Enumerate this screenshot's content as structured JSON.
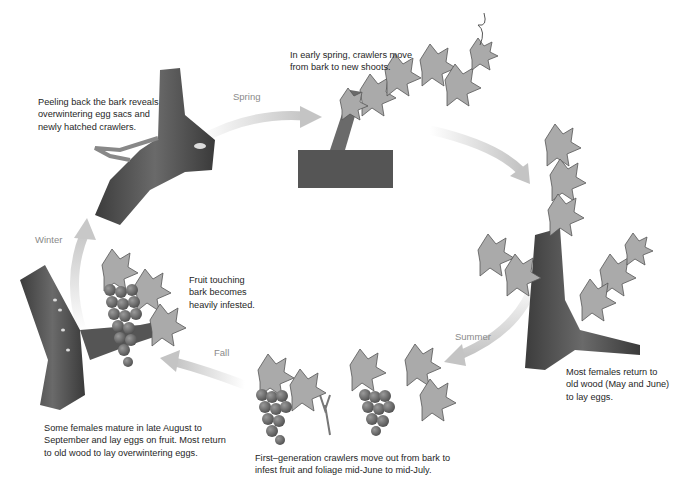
{
  "seasons": {
    "spring": "Spring",
    "summer": "Summer",
    "fall": "Fall",
    "winter": "Winter"
  },
  "captions": {
    "winter_bark": [
      "Peeling back the bark reveals",
      "overwintering egg sacs and",
      "newly hatched crawlers."
    ],
    "spring_shoots": [
      "In early spring, crawlers move",
      "from bark to new shoots."
    ],
    "summer_old_wood": [
      "Most females return to",
      "old wood (May and June)",
      "to lay eggs."
    ],
    "first_generation": [
      "First–generation crawlers move out from bark to",
      "infest fruit and foliage mid-June to mid-July."
    ],
    "fruit_touching": [
      "Fruit touching",
      "bark becomes",
      "heavily infested."
    ],
    "fall_females": [
      "Some females mature in late August to",
      "September and lay eggs on fruit. Most return",
      "to old wood to lay overwintering eggs."
    ]
  },
  "colors": {
    "arrow": "#c8c8c8",
    "bark_dark": "#4a4a4a",
    "bark_mid": "#7a7a7a",
    "leaf": "#a9a9a9",
    "grape": "#6e6e6e",
    "text": "#262626",
    "season_text": "#8a8a8a"
  }
}
